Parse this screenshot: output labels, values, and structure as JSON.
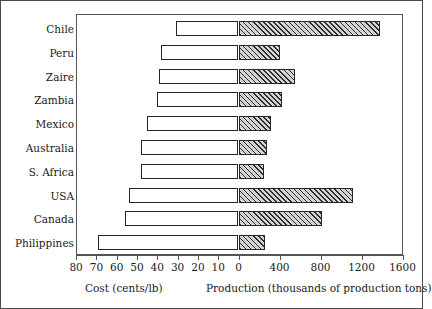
{
  "chart_data": {
    "type": "bar",
    "orientation": "horizontal-diverging",
    "title": "",
    "subtitle": "",
    "categories": [
      "Chile",
      "Peru",
      "Zaire",
      "Zambia",
      "Mexico",
      "Australia",
      "S. Africa",
      "USA",
      "Canada",
      "Philippines"
    ],
    "series": [
      {
        "name": "Cost (cents/lb)",
        "axis": "left",
        "direction": "left",
        "fill": "white",
        "values": [
          31,
          38,
          39,
          40,
          45,
          48,
          48,
          54,
          56,
          69
        ]
      },
      {
        "name": "Production (thousands of production tons)",
        "axis": "right",
        "direction": "right",
        "fill": "hatched",
        "values": [
          1380,
          400,
          550,
          420,
          320,
          280,
          250,
          1120,
          810,
          260
        ]
      }
    ],
    "left_axis": {
      "label": "Cost (cents/lb)",
      "ticks": [
        80,
        70,
        60,
        50,
        40,
        30,
        20,
        10,
        0
      ],
      "min": 0,
      "max": 80,
      "reversed": true
    },
    "right_axis": {
      "label": "Production (thousands of production tons)",
      "ticks": [
        0,
        400,
        800,
        1200,
        1600
      ],
      "min": 0,
      "max": 1600
    },
    "grid": false,
    "legend": "none",
    "colors": {
      "bar_outline": "#262626",
      "cost_fill": "#ffffff",
      "production_fill": "#d4d4d4",
      "frame": "#555555",
      "text": "#1a1a1a"
    }
  },
  "axis_tick_labels": {
    "cost": [
      "80",
      "70",
      "60",
      "50",
      "40",
      "30",
      "20",
      "10",
      "0"
    ],
    "production": [
      "400",
      "800",
      "1200",
      "1600"
    ]
  },
  "axis_titles": {
    "cost": "Cost (cents/lb)",
    "production": "Production (thousands of production tons)"
  }
}
